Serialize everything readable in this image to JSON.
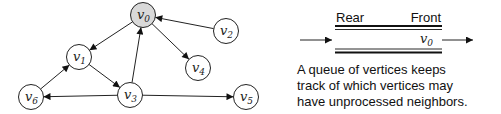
{
  "graph": {
    "nodes": [
      {
        "id": "v0",
        "base": "v",
        "sub": "0",
        "highlighted": true
      },
      {
        "id": "v1",
        "base": "v",
        "sub": "1",
        "highlighted": false
      },
      {
        "id": "v2",
        "base": "v",
        "sub": "2",
        "highlighted": false
      },
      {
        "id": "v3",
        "base": "v",
        "sub": "3",
        "highlighted": false
      },
      {
        "id": "v4",
        "base": "v",
        "sub": "4",
        "highlighted": false
      },
      {
        "id": "v5",
        "base": "v",
        "sub": "5",
        "highlighted": false
      },
      {
        "id": "v6",
        "base": "v",
        "sub": "6",
        "highlighted": false
      }
    ],
    "edges": [
      {
        "from": "v0",
        "to": "v1"
      },
      {
        "from": "v0",
        "to": "v4"
      },
      {
        "from": "v2",
        "to": "v0"
      },
      {
        "from": "v1",
        "to": "v3"
      },
      {
        "from": "v3",
        "to": "v0"
      },
      {
        "from": "v3",
        "to": "v6"
      },
      {
        "from": "v3",
        "to": "v5"
      },
      {
        "from": "v6",
        "to": "v1"
      }
    ],
    "highlight_color": "#d9d9d9"
  },
  "queue": {
    "rear_label": "Rear",
    "front_label": "Front",
    "contents": [
      {
        "base": "v",
        "sub": "0"
      }
    ]
  },
  "caption": {
    "lines": [
      "A queue of vertices keeps",
      "track of which vertices may",
      "have unprocessed neighbors."
    ]
  }
}
